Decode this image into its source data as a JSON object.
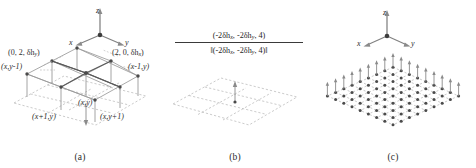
{
  "figure": {
    "type": "scientific-diagram",
    "background_color": "#ffffff",
    "ink_color": "#2e2e2e"
  },
  "axes": {
    "x_label": "x",
    "y_label": "y",
    "z_label": "z"
  },
  "panel_a": {
    "caption": "(a)",
    "labels": {
      "top_left": "(0, 2, δh",
      "top_left_sub": "y",
      "top_left_end": ")",
      "top_right": "(2, 0, δh",
      "top_right_sub": "x",
      "top_right_end": ")",
      "left_mid": "(x,y-1)",
      "right_mid": "(x-1,y)",
      "center": "(x,y)",
      "bottom_left": "(x+1,y)",
      "bottom_right": "(x,y+1)"
    }
  },
  "panel_b": {
    "caption": "(b)",
    "formula": {
      "numerator_prefix": "(-2δh",
      "numerator_sub1": "x",
      "numerator_mid": ", -2δh",
      "numerator_sub2": "y",
      "numerator_suffix": ", 4)",
      "denominator_prefix": "‖(-2δh",
      "denominator_sub1": "x",
      "denominator_mid": ", -2δh",
      "denominator_sub2": "y",
      "denominator_suffix": ", 4)‖"
    }
  },
  "panel_c": {
    "caption": "(c)",
    "grid_rows": 9,
    "grid_cols": 9
  }
}
